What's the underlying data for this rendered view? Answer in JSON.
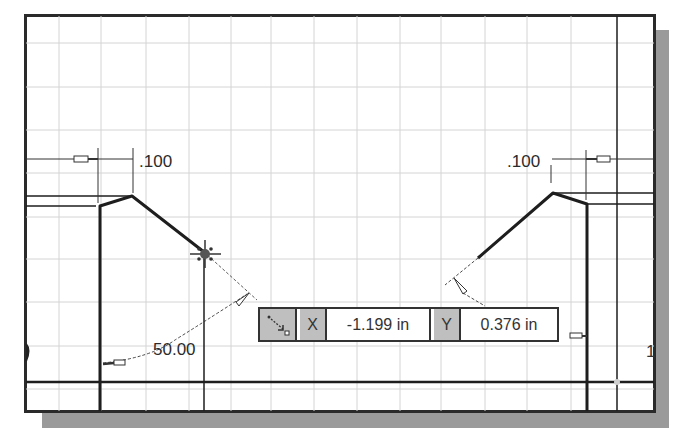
{
  "sketch": {
    "dimensions": {
      "left_offset": ".100",
      "right_offset": ".100",
      "angle": "50.00"
    },
    "sheet_marker": "1"
  },
  "coordinate_entry": {
    "mode_icon": "precise-input-icon",
    "x_label": "X",
    "x_value": "-1.199 in",
    "y_label": "Y",
    "y_value": "0.376 in"
  },
  "colors": {
    "grid": "#d4d4d4",
    "geometry": "#1e1e1e",
    "dimension": "#333333",
    "entry_label_bg": "#bfbfbf",
    "shadow": "#9a9a9a"
  }
}
